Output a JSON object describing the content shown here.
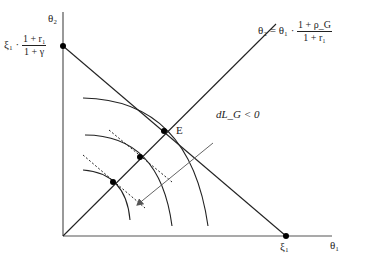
{
  "diagram": {
    "axes": {
      "y_label": "θ₂",
      "x_label": "θ₁"
    },
    "y_intercept_label": {
      "prefix": "ξ₁ ·",
      "numerator": "1 + r₁",
      "denominator": "1 + γ"
    },
    "x_intercept_label": "ξ₁",
    "ray_label": {
      "prefix": "θ₂ = θ₁ ·",
      "numerator": "1 + ρ_G",
      "denominator": "1 + r₁"
    },
    "equilibrium_label": "E",
    "arrow_label": "dL_G < 0",
    "colors": {
      "line": "#222222",
      "axis": "#555555",
      "arrow": "#777777",
      "background": "#ffffff"
    }
  }
}
